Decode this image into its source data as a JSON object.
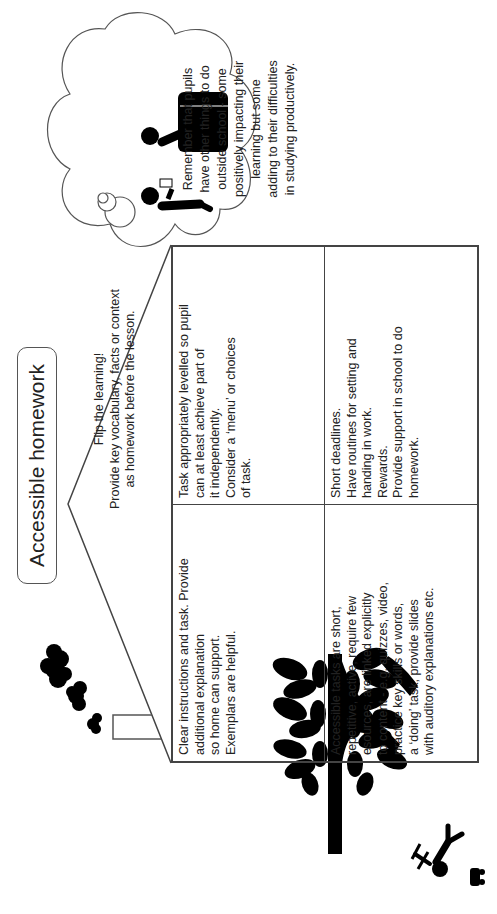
{
  "title": "Accessible homework",
  "roof": {
    "line1": "Flip the learning!",
    "line2": "Provide key vocabulary, facts or context",
    "line3": "as homework before the lesson."
  },
  "cells": [
    {
      "text": "Clear instructions and task. Provide\nadditional explanation\nso home can support.\nExemplars are helpful."
    },
    {
      "text": "Task appropriately levelled so pupil\ncan at least achieve part of\nit independently.\nConsider a ‘menu’ or choices\nof task."
    },
    {
      "text": "Accessible tasks are short,\nrepetitive, active, require few\nesources, are linked explicitly\nto content - e.g. quizzes, video,\npractice key skills or words,\na ‘doing’ task, provide slides\nwith auditory explanations etc."
    },
    {
      "text": "Short deadlines.\nHave routines for setting and\nhanding in work.\nRewards.\nProvide support in school to do\nhomework."
    }
  ],
  "thought_bubble": {
    "lines": [
      "Remember that pupils",
      "have other things to do",
      "outside school - some",
      "positively impacting their",
      "learning but some",
      "adding to their difficulties",
      "in studying productively."
    ]
  },
  "icons": [
    "smoke-icon",
    "chimney-icon",
    "tree-icon",
    "child-playing-icon",
    "toy-car-icon",
    "people-at-desk-icon",
    "thought-bubble-icon"
  ],
  "colors": {
    "line": "#444444",
    "fill": "#000000",
    "background": "#ffffff"
  }
}
